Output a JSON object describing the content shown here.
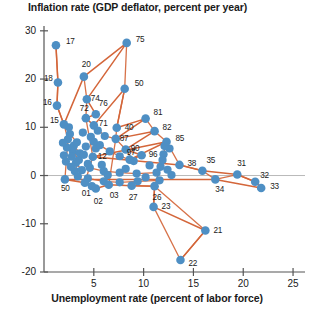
{
  "chart_data": {
    "type": "scatter",
    "title": "Inflation rate (GDP deflator, percent per year)",
    "subtitle": "",
    "xlabel": "Unemployment rate (percent of labor force)",
    "ylabel": "Inflation rate (GDP deflator, percent per year)",
    "xlim": [
      0,
      26.2
    ],
    "ylim": [
      -20,
      31
    ],
    "xticks": [
      5,
      10,
      15,
      20,
      25
    ],
    "xtick_labels": [
      "5",
      "10",
      "15",
      "20",
      "25"
    ],
    "yticks": [
      30,
      20,
      10,
      0,
      -10,
      -20
    ],
    "ytick_labels": [
      "30",
      "20",
      "10",
      "0",
      "-10",
      "-20"
    ],
    "grid": false,
    "legend": false,
    "zero_line": true,
    "series_name": "Year (connected in chronological order)",
    "point_color": "#4e8fc4",
    "line_color": "#d4663a",
    "axis_color": "#555555",
    "text_color": "#1a1a1a",
    "points": [
      {
        "label": "17",
        "x": 1.2,
        "y": 27.0,
        "lx": 10,
        "ly": -4
      },
      {
        "label": "18",
        "x": 1.4,
        "y": 19.3,
        "lx": -14,
        "ly": -4
      },
      {
        "label": "16",
        "x": 1.3,
        "y": 14.5,
        "lx": -14,
        "ly": -4
      },
      {
        "label": "15",
        "x": 2.0,
        "y": 10.6,
        "lx": -14,
        "ly": -4
      },
      {
        "label": "20",
        "x": 4.0,
        "y": 20.5,
        "lx": -2,
        "ly": -13
      },
      {
        "label": "75",
        "x": 8.3,
        "y": 27.5,
        "lx": 9,
        "ly": -4
      },
      {
        "label": "74",
        "x": 4.3,
        "y": 15.8,
        "lx": 4,
        "ly": -1
      },
      {
        "label": "76",
        "x": 5.2,
        "y": 12.7,
        "lx": 3,
        "ly": -11
      },
      {
        "label": "72",
        "x": 4.2,
        "y": 11.9,
        "lx": -6,
        "ly": -10
      },
      {
        "label": "71",
        "x": 5.0,
        "y": 10.4,
        "lx": 5,
        "ly": -2
      },
      {
        "label": "50",
        "x": 8.1,
        "y": 18.0,
        "lx": 10,
        "ly": -6
      },
      {
        "label": "40",
        "x": 7.3,
        "y": 9.9,
        "lx": 8,
        "ly": -1
      },
      {
        "label": "81",
        "x": 10.2,
        "y": 11.8,
        "lx": 8,
        "ly": -7
      },
      {
        "label": "87",
        "x": 7.2,
        "y": 7.6,
        "lx": 4,
        "ly": -1
      },
      {
        "label": "82",
        "x": 11.1,
        "y": 9.2,
        "lx": 8,
        "ly": -4
      },
      {
        "label": "90",
        "x": 8.2,
        "y": 5.4,
        "lx": 5,
        "ly": -1
      },
      {
        "label": "96",
        "x": 9.8,
        "y": 4.2,
        "lx": 7,
        "ly": -1
      },
      {
        "label": "97",
        "x": 8.6,
        "y": 3.3,
        "lx": -3,
        "ly": -8
      },
      {
        "label": "85",
        "x": 12.3,
        "y": 7.0,
        "lx": 9,
        "ly": -4
      },
      {
        "label": "12",
        "x": 4.9,
        "y": 3.9,
        "lx": 5,
        "ly": -1
      },
      {
        "label": "38",
        "x": 13.6,
        "y": 2.2,
        "lx": 8,
        "ly": -2
      },
      {
        "label": "35",
        "x": 15.9,
        "y": 1.0,
        "lx": 4,
        "ly": -11
      },
      {
        "label": "31",
        "x": 19.4,
        "y": 0.2,
        "lx": 0,
        "ly": -12
      },
      {
        "label": "32",
        "x": 21.2,
        "y": -1.3,
        "lx": 5,
        "ly": -7
      },
      {
        "label": "33",
        "x": 21.8,
        "y": -2.6,
        "lx": 9,
        "ly": -2
      },
      {
        "label": "34",
        "x": 17.2,
        "y": -0.8,
        "lx": 0,
        "ly": 10
      },
      {
        "label": "50",
        "x": 2.1,
        "y": -0.8,
        "lx": -4,
        "ly": 9
      },
      {
        "label": "01",
        "x": 4.1,
        "y": -1.5,
        "lx": -3,
        "ly": 10
      },
      {
        "label": "02",
        "x": 5.2,
        "y": -2.7,
        "lx": -2,
        "ly": 12
      },
      {
        "label": "03",
        "x": 6.5,
        "y": -1.9,
        "lx": 1,
        "ly": 10
      },
      {
        "label": "27",
        "x": 8.8,
        "y": -2.1,
        "lx": -3,
        "ly": 11
      },
      {
        "label": "26",
        "x": 11.1,
        "y": -2.2,
        "lx": -2,
        "ly": 11
      },
      {
        "label": "23",
        "x": 11.0,
        "y": -6.5,
        "lx": 8,
        "ly": -1
      },
      {
        "label": "21",
        "x": 16.2,
        "y": -11.4,
        "lx": 8,
        "ly": -1
      },
      {
        "label": "22",
        "x": 13.7,
        "y": -17.5,
        "lx": 8,
        "ly": 3
      }
    ],
    "path_order": [
      "17",
      "18",
      "16",
      "15",
      "20",
      "74",
      "72",
      "76",
      "71",
      "50",
      "75",
      "40",
      "81",
      "87",
      "82",
      "90",
      "96",
      "97",
      "85",
      "12",
      "38",
      "35",
      "31",
      "32",
      "33",
      "34",
      "50b",
      "01",
      "02",
      "03",
      "27",
      "26",
      "23",
      "21",
      "22"
    ]
  }
}
